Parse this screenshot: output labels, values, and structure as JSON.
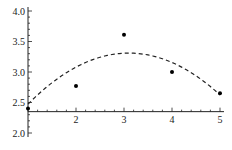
{
  "chart_data": {
    "type": "scatter",
    "title": "",
    "xlabel": "",
    "ylabel": "",
    "xlim": [
      1,
      5
    ],
    "ylim": [
      2.0,
      4.0
    ],
    "x_axis_crosses_y_at": 2.35,
    "grid": false,
    "legend": "none",
    "x_ticks": [
      2,
      3,
      4,
      5
    ],
    "x_tick_labels": [
      "2",
      "3",
      "4",
      "5"
    ],
    "y_ticks": [
      2.0,
      2.5,
      3.0,
      3.5,
      4.0
    ],
    "y_tick_labels": [
      "2.0",
      "2.5",
      "3.0",
      "3.5",
      "4.0"
    ],
    "series": [
      {
        "name": "data points",
        "type": "scatter",
        "x": [
          1,
          2,
          3,
          4,
          5
        ],
        "y": [
          2.4,
          2.77,
          3.61,
          3.0,
          2.65
        ]
      },
      {
        "name": "quadratic fit",
        "type": "line",
        "style": "dashed",
        "form": "y = a*(x-h)^2 + k",
        "a": -0.19,
        "h": 3.1,
        "k": 3.31,
        "x_range": [
          1,
          5
        ]
      }
    ]
  }
}
